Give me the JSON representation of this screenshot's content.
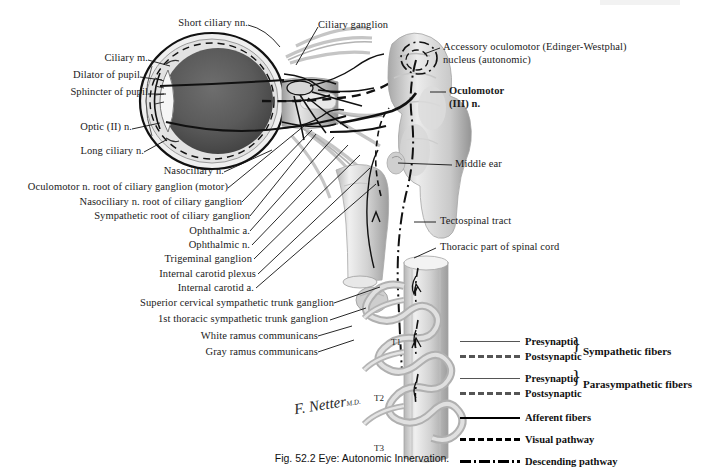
{
  "figure": {
    "caption": "Fig. 52.2  Eye: Autonomic Innervation.",
    "signature": "F. Netter",
    "signature_suffix": "M.D."
  },
  "labels_left": [
    {
      "id": "short-ciliary-nn",
      "text": "Short ciliary nn."
    },
    {
      "id": "ciliary-m",
      "text": "Ciliary m."
    },
    {
      "id": "dilator-of-pupil",
      "text": "Dilator of pupil"
    },
    {
      "id": "sphincter-of-pupil",
      "text": "Sphincter of pupil"
    },
    {
      "id": "optic-n",
      "text": "Optic (II) n."
    },
    {
      "id": "long-ciliary-n",
      "text": "Long ciliary n."
    },
    {
      "id": "nasociliary-n",
      "text": "Nasociliary n."
    },
    {
      "id": "oculomotor-root",
      "text": "Oculomotor n. root of ciliary ganglion (motor)"
    },
    {
      "id": "nasociliary-root",
      "text": "Nasociliary n. root  of ciliary ganglion"
    },
    {
      "id": "sympathetic-root",
      "text": "Sympathetic root of ciliary ganglion"
    },
    {
      "id": "ophthalmic-a",
      "text": "Ophthalmic a."
    },
    {
      "id": "ophthalmic-n",
      "text": "Ophthalmic n."
    },
    {
      "id": "trigeminal-ganglion",
      "text": "Trigeminal ganglion"
    },
    {
      "id": "internal-carotid-plexus",
      "text": "Internal  carotid plexus"
    },
    {
      "id": "internal-carotid-a",
      "text": "Internal carotid a."
    },
    {
      "id": "superior-cervical-ganglion",
      "text": "Superior cervical sympathetic trunk ganglion"
    },
    {
      "id": "first-thoracic-ganglion",
      "text": "1st thoracic sympathetic trunk ganglion"
    },
    {
      "id": "white-ramus",
      "text": "White ramus communicans"
    },
    {
      "id": "gray-ramus",
      "text": "Gray ramus communicans"
    }
  ],
  "labels_top": [
    {
      "id": "ciliary-ganglion",
      "text": "Ciliary ganglion"
    }
  ],
  "labels_right": [
    {
      "id": "accessory-oculomotor-nucleus",
      "line1": "Accessory oculomotor (Edinger-Westphal)",
      "line2": "nucleus (autonomic)"
    },
    {
      "id": "oculomotor-n",
      "line1": "Oculomotor",
      "line2": "(III) n."
    },
    {
      "id": "middle-ear",
      "line1": "Middle ear",
      "line2": ""
    },
    {
      "id": "tectospinal-tract",
      "line1": "Tectospinal  tract",
      "line2": ""
    },
    {
      "id": "thoracic-spinal-cord",
      "line1": "Thoracic part of spinal cord",
      "line2": ""
    }
  ],
  "vertebra_labels": [
    {
      "id": "t1",
      "text": "T1"
    },
    {
      "id": "t2",
      "text": "T2"
    },
    {
      "id": "t3",
      "text": "T3"
    }
  ],
  "legend": {
    "rows": [
      {
        "id": "sym-presynaptic",
        "style": "solid-gray",
        "text": "Presynaptic"
      },
      {
        "id": "sym-postsynaptic",
        "style": "dash-gray",
        "text": "Postsynaptic"
      },
      {
        "id": "para-presynaptic",
        "style": "solid-gray",
        "text": "Presynaptic"
      },
      {
        "id": "para-postsynaptic",
        "style": "dash-gray",
        "text": "Postsynaptic"
      },
      {
        "id": "afferent-fibers",
        "style": "solid-black",
        "text": "Afferent fibers"
      },
      {
        "id": "visual-pathway",
        "style": "dash-black",
        "text": "Visual pathway"
      },
      {
        "id": "descending-pathway",
        "style": "dashdot-black",
        "text": "Descending pathway"
      }
    ],
    "groups": [
      {
        "id": "sympathetic-fibers",
        "text": "Sympathetic fibers"
      },
      {
        "id": "parasympathetic-fibers",
        "text": "Parasympathetic fibers"
      }
    ],
    "brace": "}"
  },
  "colors": {
    "background": "#ffffff",
    "ink": "#111111",
    "gray_line": "#555555",
    "anatomy_light": "#d9d9d9",
    "anatomy_mid": "#b3b3b3",
    "anatomy_dark": "#808080",
    "globe_dark": "#4a4a4a"
  }
}
